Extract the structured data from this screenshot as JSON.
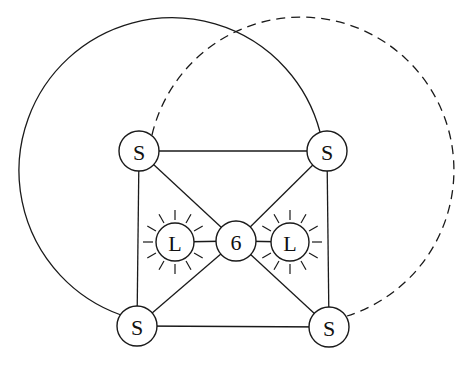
{
  "diagram": {
    "nodes": [
      {
        "id": "s_top_left",
        "label": "S",
        "x": 139,
        "y": 151,
        "r": 20,
        "type": "S"
      },
      {
        "id": "s_top_right",
        "label": "S",
        "x": 327,
        "y": 151,
        "r": 20,
        "type": "S"
      },
      {
        "id": "s_bottom_left",
        "label": "S",
        "x": 137,
        "y": 326,
        "r": 20,
        "type": "S"
      },
      {
        "id": "s_bottom_right",
        "label": "S",
        "x": 329,
        "y": 327,
        "r": 20,
        "type": "S"
      },
      {
        "id": "center",
        "label": "6",
        "x": 236,
        "y": 241,
        "r": 20,
        "type": "center"
      },
      {
        "id": "l_left",
        "label": "L",
        "x": 175,
        "y": 242,
        "r": 19,
        "type": "L"
      },
      {
        "id": "l_right",
        "label": "L",
        "x": 290,
        "y": 242,
        "r": 19,
        "type": "L"
      }
    ],
    "edges": [
      {
        "from": "s_top_left",
        "to": "s_top_right",
        "style": "solid"
      },
      {
        "from": "s_bottom_left",
        "to": "s_bottom_right",
        "style": "solid"
      },
      {
        "from": "s_top_left",
        "to": "s_bottom_left",
        "style": "solid"
      },
      {
        "from": "s_top_right",
        "to": "s_bottom_right",
        "style": "solid"
      },
      {
        "from": "s_top_left",
        "to": "center",
        "style": "solid"
      },
      {
        "from": "s_top_right",
        "to": "center",
        "style": "solid"
      },
      {
        "from": "s_bottom_left",
        "to": "center",
        "style": "solid"
      },
      {
        "from": "s_bottom_right",
        "to": "center",
        "style": "solid"
      },
      {
        "from": "l_left",
        "to": "center",
        "style": "solid"
      },
      {
        "from": "l_right",
        "to": "center",
        "style": "solid"
      },
      {
        "from": "s_top_right",
        "to": "s_bottom_left",
        "style": "solid",
        "shape": "outer-arc-left"
      },
      {
        "from": "s_top_left",
        "to": "s_bottom_right",
        "style": "dashed",
        "shape": "outer-arc-right"
      }
    ]
  }
}
